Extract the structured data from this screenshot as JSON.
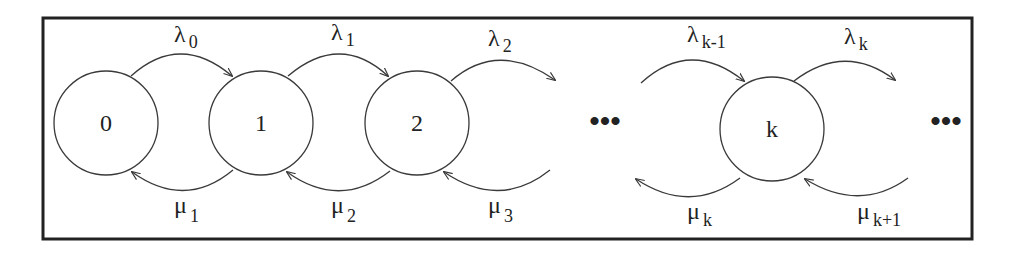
{
  "diagram": {
    "type": "birth-death Markov chain",
    "colors": {
      "stroke": "#3a3a3a",
      "frame": "#222222",
      "text": "#222222",
      "background": "#ffffff"
    },
    "states": [
      {
        "id": "0",
        "label": "0"
      },
      {
        "id": "1",
        "label": "1"
      },
      {
        "id": "2",
        "label": "2"
      },
      {
        "id": "k",
        "label": "k"
      }
    ],
    "ellipsis": [
      "•••",
      "•••"
    ],
    "arrival_rates": [
      {
        "symbol": "λ",
        "sub": "0",
        "from": "0",
        "to": "1"
      },
      {
        "symbol": "λ",
        "sub": "1",
        "from": "1",
        "to": "2"
      },
      {
        "symbol": "λ",
        "sub": "2",
        "from": "2",
        "to": "…"
      },
      {
        "symbol": "λ",
        "sub": "k-1",
        "from": "…",
        "to": "k"
      },
      {
        "symbol": "λ",
        "sub": "k",
        "from": "k",
        "to": "…"
      }
    ],
    "service_rates": [
      {
        "symbol": "μ",
        "sub": "1",
        "from": "1",
        "to": "0"
      },
      {
        "symbol": "μ",
        "sub": "2",
        "from": "2",
        "to": "1"
      },
      {
        "symbol": "μ",
        "sub": "3",
        "from": "…",
        "to": "2"
      },
      {
        "symbol": "μ",
        "sub": "k",
        "from": "k",
        "to": "…"
      },
      {
        "symbol": "μ",
        "sub": "k+1",
        "from": "…",
        "to": "k"
      }
    ]
  }
}
